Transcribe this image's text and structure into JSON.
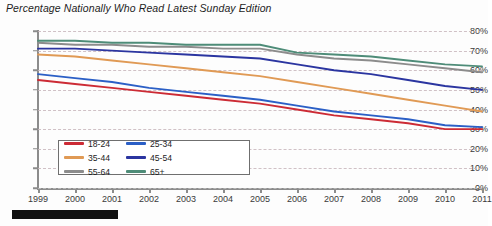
{
  "chart_data": {
    "type": "line",
    "title": "Percentage Nationally Who Read Latest Sunday Edition",
    "xlabel": "",
    "ylabel": "",
    "ylim": [
      0,
      80
    ],
    "ytick_labels": [
      "0%",
      "10%",
      "20%",
      "30%",
      "40%",
      "50%",
      "60%",
      "70%",
      "80%"
    ],
    "ytick_values": [
      0,
      10,
      20,
      30,
      40,
      50,
      60,
      70,
      80
    ],
    "grid": true,
    "legend_position": "inside-lower-left",
    "x": [
      1999,
      2000,
      2001,
      2002,
      2003,
      2004,
      2005,
      2006,
      2007,
      2008,
      2009,
      2010,
      2011
    ],
    "categories": [
      "1999",
      "2000",
      "2001",
      "2002",
      "2003",
      "2004",
      "2005",
      "2006",
      "2007",
      "2008",
      "2009",
      "2010",
      "2011"
    ],
    "series": [
      {
        "name": "18-24",
        "color": "#cc2b35",
        "values": [
          55,
          53,
          51,
          49,
          47,
          45,
          43,
          40,
          37,
          35,
          33,
          30,
          30
        ]
      },
      {
        "name": "25-34",
        "color": "#2b5fc6",
        "values": [
          58,
          56,
          54,
          51,
          49,
          47,
          45,
          42,
          39,
          37,
          35,
          32,
          31
        ]
      },
      {
        "name": "35-44",
        "color": "#e09a55",
        "values": [
          68,
          67,
          65,
          63,
          61,
          59,
          57,
          54,
          51,
          48,
          45,
          42,
          39
        ]
      },
      {
        "name": "45-54",
        "color": "#2b35a0",
        "values": [
          71,
          71,
          70,
          69,
          68,
          67,
          66,
          63,
          60,
          58,
          55,
          52,
          50
        ]
      },
      {
        "name": "55-64",
        "color": "#8c8c8c",
        "values": [
          74,
          73,
          73,
          72,
          72,
          71,
          71,
          68,
          66,
          65,
          63,
          61,
          59
        ]
      },
      {
        "name": "65+",
        "color": "#4e8c78",
        "values": [
          75,
          75,
          74,
          74,
          73,
          73,
          73,
          69,
          68,
          67,
          65,
          63,
          62
        ]
      }
    ],
    "legend_entries": [
      "18-24",
      "25-34",
      "35-44",
      "45-54",
      "55-64",
      "65+"
    ]
  }
}
